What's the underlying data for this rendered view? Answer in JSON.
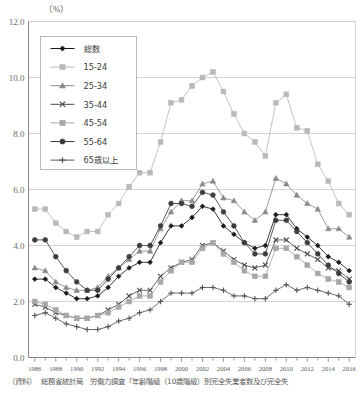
{
  "chart_data": {
    "type": "line",
    "title": "",
    "unit_label": "（%）",
    "xlabel": "",
    "ylabel": "",
    "ylim": [
      0.0,
      12.0
    ],
    "ytick_labels": [
      "0.0",
      "2.0",
      "4.0",
      "6.0",
      "8.0",
      "10.0",
      "12.0"
    ],
    "ytick_values": [
      0.0,
      2.0,
      4.0,
      6.0,
      8.0,
      10.0,
      12.0
    ],
    "grid": true,
    "legend_position": "upper-left",
    "x": [
      1986,
      1987,
      1988,
      1989,
      1990,
      1991,
      1992,
      1993,
      1994,
      1995,
      1996,
      1997,
      1998,
      1999,
      2000,
      2001,
      2002,
      2003,
      2004,
      2005,
      2006,
      2007,
      2008,
      2009,
      2010,
      2011,
      2012,
      2013,
      2014,
      2015,
      2016
    ],
    "xtick_labels": [
      "1986",
      "1988",
      "1990",
      "1992",
      "1994",
      "1996",
      "1998",
      "2000",
      "2002",
      "2004",
      "2006",
      "2008",
      "2010",
      "2012",
      "2014",
      "2016"
    ],
    "xtick_values": [
      1986,
      1988,
      1990,
      1992,
      1994,
      1996,
      1998,
      2000,
      2002,
      2004,
      2006,
      2008,
      2010,
      2012,
      2014,
      2016
    ],
    "xlim": [
      1985.4,
      2016.6
    ],
    "series": [
      {
        "name": "総数",
        "marker": "diamond",
        "color": "#1a1a1a",
        "values": [
          2.8,
          2.8,
          2.5,
          2.3,
          2.1,
          2.1,
          2.2,
          2.5,
          2.9,
          3.2,
          3.4,
          3.4,
          4.1,
          4.7,
          4.7,
          5.0,
          5.4,
          5.3,
          4.7,
          4.4,
          4.1,
          3.9,
          4.0,
          5.1,
          5.1,
          4.6,
          4.3,
          4.0,
          3.6,
          3.4,
          3.1
        ]
      },
      {
        "name": "15-24",
        "marker": "square",
        "color": "#b9b9b9",
        "values": [
          5.3,
          5.3,
          4.8,
          4.5,
          4.3,
          4.5,
          4.5,
          5.1,
          5.5,
          6.1,
          6.6,
          6.6,
          7.7,
          9.1,
          9.2,
          9.7,
          10.0,
          10.2,
          9.5,
          8.7,
          8.0,
          7.7,
          7.2,
          9.1,
          9.4,
          8.2,
          8.1,
          6.9,
          6.3,
          5.5,
          5.1
        ]
      },
      {
        "name": "25-34",
        "marker": "triangle",
        "color": "#8a8a8a",
        "values": [
          3.2,
          3.1,
          2.7,
          2.5,
          2.4,
          2.4,
          2.5,
          2.9,
          3.2,
          3.5,
          3.8,
          3.8,
          4.6,
          5.2,
          5.6,
          5.6,
          6.2,
          6.3,
          5.7,
          5.6,
          5.2,
          4.9,
          5.2,
          6.4,
          6.2,
          5.8,
          5.5,
          5.3,
          4.6,
          4.6,
          4.3
        ]
      },
      {
        "name": "35-44",
        "marker": "x",
        "color": "#4a4a4a",
        "values": [
          1.9,
          1.8,
          1.6,
          1.5,
          1.4,
          1.4,
          1.5,
          1.7,
          1.9,
          2.2,
          2.4,
          2.4,
          2.9,
          3.2,
          3.4,
          3.5,
          4.0,
          4.1,
          3.8,
          3.5,
          3.3,
          3.2,
          3.3,
          4.2,
          4.2,
          3.9,
          3.7,
          3.5,
          3.2,
          3.1,
          2.8
        ]
      },
      {
        "name": "45-54",
        "marker": "square",
        "color": "#a8a8a8",
        "values": [
          2.0,
          1.9,
          1.7,
          1.5,
          1.4,
          1.4,
          1.5,
          1.6,
          1.8,
          2.0,
          2.2,
          2.2,
          2.7,
          3.1,
          3.4,
          3.4,
          3.9,
          4.1,
          3.7,
          3.4,
          3.1,
          2.9,
          2.9,
          3.9,
          3.9,
          3.6,
          3.3,
          3.0,
          2.8,
          2.7,
          2.5
        ]
      },
      {
        "name": "55-64",
        "marker": "circle",
        "color": "#3d3d3d",
        "values": [
          4.2,
          4.2,
          3.6,
          3.1,
          2.7,
          2.4,
          2.4,
          2.8,
          3.2,
          3.6,
          4.0,
          4.0,
          4.7,
          5.5,
          5.5,
          5.4,
          5.9,
          5.8,
          5.2,
          4.7,
          4.1,
          3.7,
          3.7,
          4.9,
          4.9,
          4.5,
          4.1,
          3.7,
          3.3,
          3.0,
          2.7
        ]
      },
      {
        "name": "65歳以上",
        "marker": "plus",
        "color": "#555555",
        "values": [
          1.5,
          1.6,
          1.4,
          1.2,
          1.1,
          1.0,
          1.0,
          1.1,
          1.3,
          1.4,
          1.6,
          1.7,
          2.0,
          2.3,
          2.3,
          2.3,
          2.5,
          2.5,
          2.4,
          2.2,
          2.2,
          2.1,
          2.1,
          2.4,
          2.6,
          2.4,
          2.5,
          2.4,
          2.3,
          2.2,
          1.9
        ]
      }
    ]
  },
  "source": {
    "label": "（資料）",
    "body": "総務省統計局　労働力調査「年齢階級（10歳階級）別完全失業者数及び完全失"
  }
}
